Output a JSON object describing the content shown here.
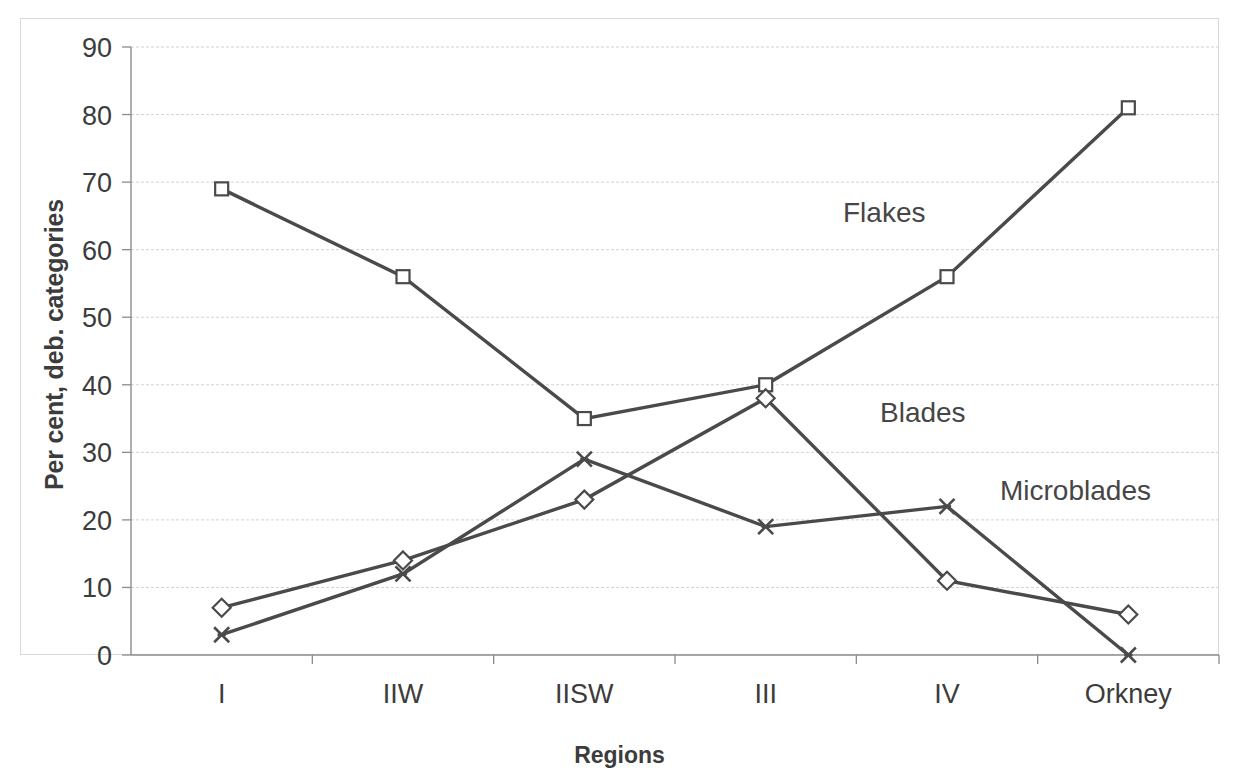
{
  "chart_data": {
    "type": "line",
    "title": "",
    "xlabel": "Regions",
    "ylabel": "Per cent, deb. categories",
    "categories": [
      "I",
      "IIW",
      "IISW",
      "III",
      "IV",
      "Orkney"
    ],
    "ylim": [
      0,
      90
    ],
    "yticks": [
      0,
      10,
      20,
      30,
      40,
      50,
      60,
      70,
      80,
      90
    ],
    "ytick_labels": [
      "0",
      "10",
      "20",
      "30",
      "40",
      "50",
      "60",
      "70",
      "80",
      "90"
    ],
    "grid": true,
    "legend_position": "inline-annotation",
    "series": [
      {
        "name": "Flakes",
        "marker": "square",
        "color": "#4a4a4a",
        "values": [
          69,
          56,
          35,
          40,
          56,
          81
        ]
      },
      {
        "name": "Blades",
        "marker": "diamond",
        "color": "#4a4a4a",
        "values": [
          7,
          14,
          23,
          38,
          11,
          6
        ]
      },
      {
        "name": "Microblades",
        "marker": "x",
        "color": "#4a4a4a",
        "values": [
          3,
          12,
          29,
          19,
          22,
          0
        ]
      }
    ],
    "annotations": [
      {
        "text": "Flakes",
        "x_px": 843,
        "y_px": 222
      },
      {
        "text": "Blades",
        "x_px": 880,
        "y_px": 422
      },
      {
        "text": "Microblades",
        "x_px": 1000,
        "y_px": 500
      }
    ]
  },
  "axes": {
    "y_title": "Per cent, deb. categories",
    "x_title": "Regions",
    "y_tick_0": "0",
    "y_tick_10": "10",
    "y_tick_20": "20",
    "y_tick_30": "30",
    "y_tick_40": "40",
    "y_tick_50": "50",
    "y_tick_60": "60",
    "y_tick_70": "70",
    "y_tick_80": "80",
    "y_tick_90": "90",
    "x_tick_0": "I",
    "x_tick_1": "IIW",
    "x_tick_2": "IISW",
    "x_tick_3": "III",
    "x_tick_4": "IV",
    "x_tick_5": "Orkney"
  },
  "annotations": {
    "flakes": "Flakes",
    "blades": "Blades",
    "microblades": "Microblades"
  },
  "colors": {
    "line": "#4a4a4a",
    "grid": "#d2d2d2",
    "axis": "#8c8c8c",
    "text": "#3c3c3c",
    "background": "#ffffff"
  }
}
